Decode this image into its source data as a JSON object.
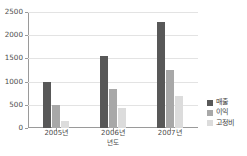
{
  "chart_data": {
    "type": "bar",
    "title": "",
    "xlabel": "년도",
    "ylabel": "",
    "categories": [
      "2005년",
      "2006년",
      "2007년"
    ],
    "series": [
      {
        "name": "매출",
        "values": [
          1000,
          1560,
          2290
        ],
        "color": "#585858"
      },
      {
        "name": "이익",
        "values": [
          490,
          850,
          1260
        ],
        "color": "#a8a8a8"
      },
      {
        "name": "고정비",
        "values": [
          150,
          440,
          700
        ],
        "color": "#dcdcdc"
      }
    ],
    "ylim": [
      0,
      2500
    ],
    "yticks": [
      0,
      500,
      1000,
      1500,
      2000,
      2500
    ],
    "ytick_labels": [
      "0",
      "500",
      "1000",
      "1500",
      "2000",
      "2500"
    ],
    "grid": true,
    "legend_position": "right"
  },
  "figure": {
    "top_strip_text": ""
  }
}
